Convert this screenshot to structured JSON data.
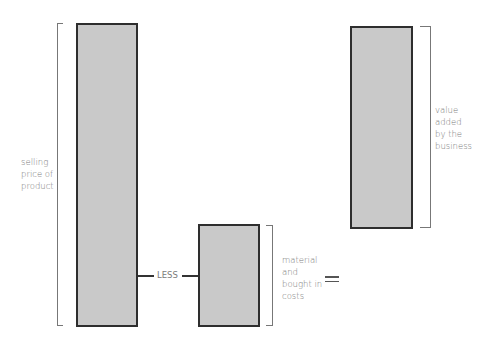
{
  "diagram": {
    "type": "value-added equation",
    "parts": [
      {
        "id": "selling-price",
        "label": "selling price of product",
        "relative_value": 100
      },
      {
        "id": "materials",
        "label": "material and bought in costs",
        "relative_value": 33
      },
      {
        "id": "value-added",
        "label": "value added by the business",
        "relative_value": 67
      }
    ],
    "operators": {
      "minus": "LESS",
      "equals": "="
    },
    "label_lines": {
      "selling": [
        "selling",
        "price of",
        "product"
      ],
      "materials": [
        "material",
        "and",
        "bought in",
        "costs"
      ],
      "value_added": [
        "value",
        "added",
        "by the",
        "business"
      ]
    },
    "colors": {
      "bar_fill": "#c9c9c9",
      "bar_stroke": "#2e2e2e",
      "text": "#7a7a7a"
    }
  }
}
